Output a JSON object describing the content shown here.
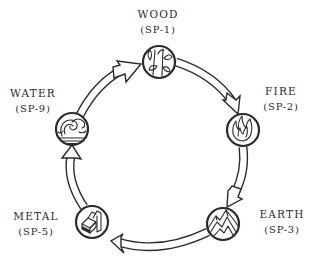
{
  "diagram": {
    "type": "cycle",
    "colors": {
      "ink": "#2b2b2b",
      "background": "#ffffff"
    },
    "nodes": [
      {
        "id": "wood",
        "name": "WOOD",
        "code": "(SP-1)",
        "icon": "bamboo-leaves-icon"
      },
      {
        "id": "fire",
        "name": "FIRE",
        "code": "(SP-2)",
        "icon": "flame-icon"
      },
      {
        "id": "earth",
        "name": "EARTH",
        "code": "(SP-3)",
        "icon": "mountain-icon"
      },
      {
        "id": "metal",
        "name": "METAL",
        "code": "(SP-5)",
        "icon": "metal-ingots-icon"
      },
      {
        "id": "water",
        "name": "WATER",
        "code": "(SP-9)",
        "icon": "wave-icon"
      }
    ],
    "edges": [
      {
        "from": "water",
        "to": "wood"
      },
      {
        "from": "wood",
        "to": "fire"
      },
      {
        "from": "fire",
        "to": "earth"
      },
      {
        "from": "earth",
        "to": "metal"
      },
      {
        "from": "metal",
        "to": "water"
      }
    ]
  }
}
